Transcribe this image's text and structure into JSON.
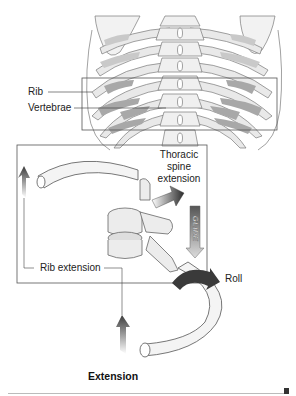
{
  "figure": {
    "labels": {
      "rib": "Rib",
      "vertebrae": "Vertebrae",
      "thoracic_spine_extension": "Thoracic\nspine\nextension",
      "thoracic_line1": "Thoracic",
      "thoracic_line2": "spine",
      "thoracic_line3": "extension",
      "glide": "GLIDE",
      "rib_extension": "Rib extension",
      "roll": "Roll"
    },
    "caption": "Extension",
    "colors": {
      "bone_fill": "#ececec",
      "bone_stroke": "#777777",
      "shade_dark": "#9a9a9a",
      "shade_mid": "#c8c8c8",
      "arrow_dark": "#3a3a3a",
      "frame": "#555555"
    }
  }
}
